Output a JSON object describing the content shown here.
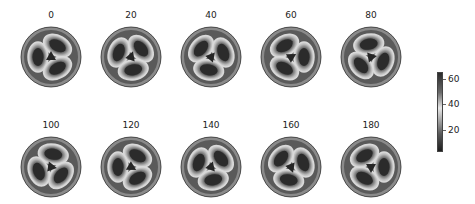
{
  "figure": {
    "panels": [
      {
        "label": "0",
        "angle": 0
      },
      {
        "label": "20",
        "angle": 20
      },
      {
        "label": "40",
        "angle": 40
      },
      {
        "label": "60",
        "angle": 60
      },
      {
        "label": "80",
        "angle": 80
      },
      {
        "label": "100",
        "angle": 100
      },
      {
        "label": "120",
        "angle": 120
      },
      {
        "label": "140",
        "angle": 140
      },
      {
        "label": "160",
        "angle": 160
      },
      {
        "label": "180",
        "angle": 180
      }
    ],
    "colorbar": {
      "ticks": [
        "60",
        "40",
        "20"
      ],
      "colormap": [
        "#2a2a2a",
        "#6a6a6a",
        "#e8e8e8",
        "#7a7a7a",
        "#1e1e1e"
      ]
    },
    "colors": {
      "disk_background": "#5a5a5a",
      "lobe_dark": "#2b2b2b",
      "ring_light": "#d9d9d9",
      "center_dark": "#262626"
    }
  }
}
